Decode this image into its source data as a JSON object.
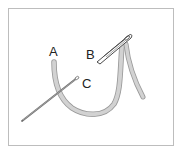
{
  "diagram": {
    "labels": {
      "a": "A",
      "b": "B",
      "c": "C"
    },
    "colors": {
      "thread": "#c9c9c9",
      "thread_edge": "#9a9a9a",
      "needle": "#7a7a7a",
      "frame": "#bdbdbd"
    }
  }
}
